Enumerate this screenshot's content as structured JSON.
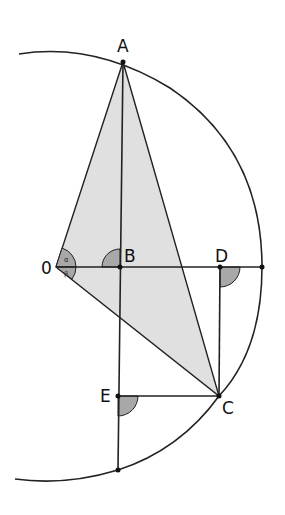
{
  "diagram": {
    "type": "geometry",
    "colors": {
      "line": "#222222",
      "triangle_fill": "#e0e0e0",
      "angle_fill": "#a8a8a8",
      "background": "#ffffff"
    },
    "points": {
      "O": {
        "label": "0",
        "x": 56,
        "y": 267
      },
      "A": {
        "label": "A",
        "x": 123,
        "y": 62
      },
      "B": {
        "label": "B",
        "x": 120,
        "y": 267
      },
      "D": {
        "label": "D",
        "x": 220,
        "y": 267
      },
      "C": {
        "label": "C",
        "x": 219,
        "y": 396
      },
      "E": {
        "label": "E",
        "x": 118,
        "y": 396
      }
    },
    "angle_labels": {
      "alpha": "α",
      "beta": "β"
    }
  }
}
